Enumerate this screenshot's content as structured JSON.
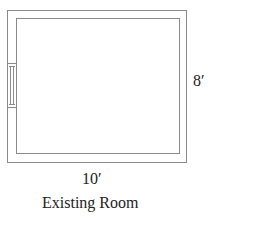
{
  "diagram": {
    "title": "Existing Room",
    "dimensions": {
      "width_label": "10′",
      "height_label": "8′"
    },
    "elements": [
      {
        "type": "outer-wall",
        "shape": "rectangle"
      },
      {
        "type": "inner-wall",
        "shape": "rectangle"
      },
      {
        "type": "window",
        "wall": "left"
      }
    ],
    "colors": {
      "line": "#8a8a8a",
      "text": "#222222",
      "background": "#ffffff"
    }
  }
}
